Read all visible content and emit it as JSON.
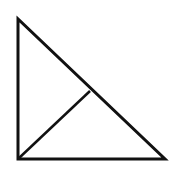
{
  "diagram": {
    "type": "right-triangle-with-altitude",
    "stroke_color": "#111111",
    "background": "#ffffff",
    "stroke_width": 3,
    "vertices": {
      "top": [
        18,
        19
      ],
      "bottom_left": [
        18,
        159
      ],
      "bottom_right": [
        165,
        159
      ]
    },
    "altitude_foot": [
      90,
      91
    ]
  }
}
